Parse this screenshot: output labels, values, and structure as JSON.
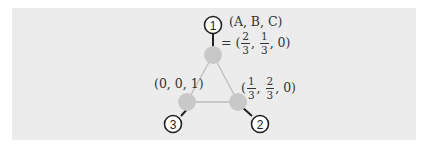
{
  "diagram": {
    "background_color": "#ececec",
    "node_color": "#c8c8c8",
    "edge_color": "#bdbdbd",
    "nodes": [
      {
        "id": "1",
        "badge": "1",
        "label_line1": "(A, B, C)",
        "label_prefix": "= (",
        "frac1": {
          "num": "2",
          "den": "3"
        },
        "frac2": {
          "num": "1",
          "den": "3"
        },
        "tail": ", 0)"
      },
      {
        "id": "2",
        "badge": "2",
        "label_prefix": "(",
        "frac1": {
          "num": "1",
          "den": "3"
        },
        "frac2": {
          "num": "2",
          "den": "3"
        },
        "tail": ", 0)"
      },
      {
        "id": "3",
        "badge": "3",
        "label": "(0, 0, 1)"
      }
    ],
    "edges": [
      [
        "1",
        "2"
      ],
      [
        "2",
        "3"
      ],
      [
        "3",
        "1"
      ]
    ]
  }
}
